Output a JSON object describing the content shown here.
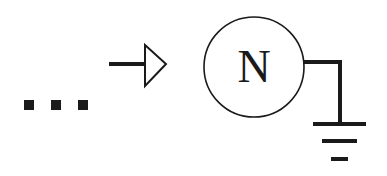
{
  "diagram": {
    "ellipsis": {
      "count": 3,
      "color": "#1a1a1a"
    },
    "arrow": {
      "style": "hollow-triangle-head",
      "direction": "right",
      "color": "#1a1a1a"
    },
    "node": {
      "label": "N",
      "shape": "circle",
      "stroke": "#1a1a1a",
      "fill": "#ffffff"
    },
    "ground": {
      "symbol": "earth-ground",
      "bars": 3,
      "color": "#1a1a1a"
    }
  }
}
